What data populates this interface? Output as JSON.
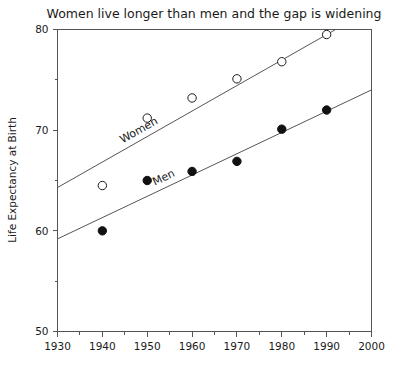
{
  "chart_data": {
    "type": "scatter",
    "title": "Women live longer than men and the gap is widening",
    "xlabel": "",
    "ylabel": "Life Expectancy at Birth",
    "xlim": [
      1930,
      2000
    ],
    "ylim": [
      50,
      80
    ],
    "grid": false,
    "legend_position": "inline-on-trendlines",
    "x": [
      1940,
      1950,
      1960,
      1970,
      1980,
      1990
    ],
    "xticks": [
      1930,
      1940,
      1950,
      1960,
      1970,
      1980,
      1990,
      2000
    ],
    "xtick_labels": [
      "1930",
      "1940",
      "1950",
      "1960",
      "1970",
      "1980",
      "1990",
      "2000"
    ],
    "xminor_ticks": [
      1935,
      1945,
      1955,
      1965,
      1975,
      1985,
      1995
    ],
    "yticks": [
      50,
      60,
      70,
      80
    ],
    "ytick_labels": [
      "50",
      "60",
      "70",
      "80"
    ],
    "yminor_ticks": [
      55,
      65,
      75
    ],
    "series": [
      {
        "name": "Women",
        "marker": "open-circle",
        "values": [
          64.5,
          71.2,
          73.2,
          75.1,
          76.8,
          79.5
        ],
        "label_text": "Women",
        "trend_start": {
          "x": 1930,
          "y": 64.3
        },
        "trend_end": {
          "x": 1992,
          "y": 80.0
        }
      },
      {
        "name": "Men",
        "marker": "filled-circle",
        "values": [
          60.0,
          65.0,
          65.9,
          66.9,
          70.1,
          72.0
        ],
        "label_text": "Men",
        "trend_start": {
          "x": 1930,
          "y": 59.2
        },
        "trend_end": {
          "x": 2000,
          "y": 74.0
        }
      }
    ]
  },
  "colors": {
    "axis": "#555555",
    "text": "#1a1a1a",
    "marker_filled": "#111111",
    "marker_open_fill": "#ffffff",
    "background": "#ffffff"
  }
}
